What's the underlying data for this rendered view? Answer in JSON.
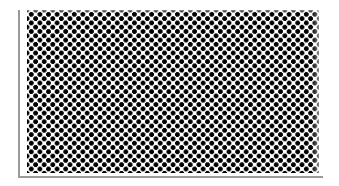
{
  "swatch": {
    "label": "Halftone dot pattern",
    "pattern": "staggered-dot-grid",
    "dot_color": "#000000",
    "background_color": "#ffffff",
    "frame_color": "#9a9a9a",
    "dot_pitch_px": 8.6,
    "dot_radius_px": 2.3
  }
}
